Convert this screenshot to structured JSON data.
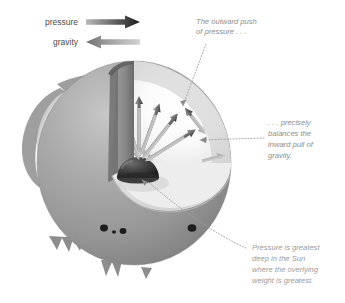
{
  "figure": {
    "title_alt": "Cutaway of the Sun showing pressure balancing gravity",
    "background": "#ffffff"
  },
  "legend": {
    "items": [
      {
        "label": "pressure",
        "direction": "right",
        "color": "#2b2b2b",
        "icon": "right-arrow-icon"
      },
      {
        "label": "gravity",
        "direction": "left",
        "color": "#8e8e8e",
        "icon": "left-arrow-icon"
      }
    ]
  },
  "annotations": [
    {
      "id": "outward-push",
      "lines": [
        "The outward push",
        "of pressure . . ."
      ],
      "position": "top-right",
      "leader": "curved-dotted"
    },
    {
      "id": "precisely-balances",
      "lines": [
        ". . . precisely",
        "balances the",
        "inward pull of",
        "gravity."
      ],
      "position": "right",
      "leader": "horizontal-dotted"
    },
    {
      "id": "pressure-greatest",
      "lines": [
        "Pressure is greatest",
        "deep in the Sun",
        "where the overlying",
        "weight is greatest."
      ],
      "position": "bottom-right",
      "leader": "curved-dotted"
    }
  ],
  "sun": {
    "body_label": "sun-sphere",
    "core_label": "sun-core",
    "cutaway_label": "cutaway-wedge",
    "interior_label": "sun-interior",
    "colors": {
      "sphere_light": "#b4b4b4",
      "sphere_mid": "#9b9b9b",
      "sphere_dark": "#787878",
      "cut_face": "#8a8a8a",
      "cut_face_dark": "#6f6f6f",
      "interior": "#fbfbfb",
      "interior_shade": "#e2e2e2",
      "core": "#3a3a3a",
      "core_edge": "#6b6b6b",
      "spot": "#1f1f1f",
      "prominence": "#8f8f8f",
      "leader": "#9a9a9a",
      "pressure_arrow": "#555555",
      "gravity_arrow": "#b9b9b9"
    },
    "features": {
      "sunspots": 4,
      "prominences": 5
    }
  }
}
